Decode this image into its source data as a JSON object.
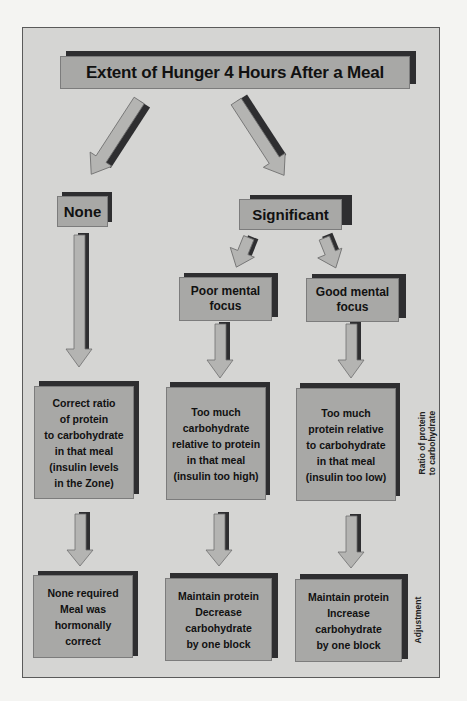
{
  "page_header": {
    "running_head": "...",
    "page_number": ""
  },
  "diagram": {
    "title": "Extent of Hunger 4 Hours After a Meal",
    "level1": {
      "left": "None",
      "right": "Significant"
    },
    "level2": {
      "left": "Poor mental focus",
      "right": "Good mental focus"
    },
    "ratio_row": {
      "side_label_line1": "Ratio of protein",
      "side_label_line2": "to carbohydrate",
      "boxes": [
        {
          "lines": [
            "Correct ratio",
            "of protein",
            "to carbohydrate",
            "in that meal",
            "(insulin levels",
            "in the Zone)"
          ]
        },
        {
          "lines": [
            "Too much",
            "carbohydrate",
            "relative to protein",
            "in that meal",
            "(insulin too high)"
          ]
        },
        {
          "lines": [
            "Too much",
            "protein relative",
            "to carbohydrate",
            "in that meal",
            "(insulin too low)"
          ]
        }
      ]
    },
    "adjustment_row": {
      "side_label": "Adjustment",
      "boxes": [
        {
          "lines": [
            "None required",
            "Meal was",
            "hormonally",
            "correct"
          ]
        },
        {
          "lines": [
            "Maintain protein",
            "Decrease",
            "carbohydrate",
            "by one block"
          ]
        },
        {
          "lines": [
            "Maintain protein",
            "Increase",
            "carbohydrate",
            "by one block"
          ]
        }
      ]
    },
    "colors": {
      "panel": "#d5d5d3",
      "box": "#a8a8a6",
      "shadow": "#2e2e30",
      "arrow": "#b4b4b2"
    }
  }
}
